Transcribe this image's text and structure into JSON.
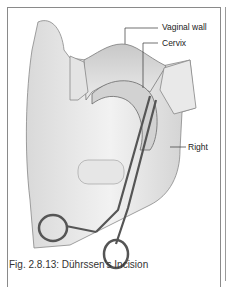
{
  "figure": {
    "labels": {
      "vaginal_wall": "Vaginal wall",
      "cervix": "Cervix",
      "right": "Right"
    },
    "caption": "Fig. 2.8.13: Dührssen's Incision"
  }
}
